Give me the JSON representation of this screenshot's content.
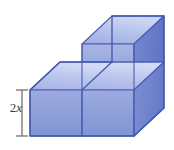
{
  "figure": {
    "background_color": "#ffffff",
    "credit": "Ilustrações: DAE",
    "dimension": {
      "label_prefix": "2",
      "label_variable": "x",
      "label_full": "2x",
      "measures": "height of lower cube layer",
      "bracket_color": "#7b7b7b"
    },
    "colors": {
      "face_top": "#aebae8",
      "face_top_light": "#c3cdee",
      "face_front": "#8f9fdb",
      "face_front_light": "#a3b1e2",
      "face_right": "#6f83cf",
      "face_right_dark": "#6276c6",
      "edge": "#4a5fb5",
      "outline": "#3f55ad"
    },
    "solid": {
      "type": "cube-stack",
      "description": "Three unit cubes: two side by side on the bottom row, one stacked on the right-hand bottom cube",
      "cube_count": 3,
      "bottom_row_cubes": 2,
      "top_row_cubes": 1,
      "projection": "oblique / cabinet"
    },
    "geometry": {
      "unit_width": 52,
      "depth_dx": 30,
      "depth_dy": -28,
      "unit_height": 46,
      "origin_x": 30,
      "origin_y": 136,
      "vertices": {
        "bottom_front_left_lower": [
          30,
          136
        ],
        "bottom_front_mid_lower": [
          82,
          136
        ],
        "bottom_front_right_lower": [
          134,
          136
        ],
        "bottom_front_left_upper": [
          30,
          90
        ],
        "bottom_front_mid_upper": [
          82,
          90
        ],
        "bottom_front_right_upper": [
          134,
          90
        ],
        "bottom_back_left_upper": [
          60,
          62
        ],
        "bottom_back_mid_upper": [
          112,
          62
        ],
        "bottom_back_right_upper": [
          164,
          62
        ],
        "bottom_back_right_lower": [
          164,
          108
        ],
        "top_front_mid_upper": [
          82,
          44
        ],
        "top_front_right_upper": [
          134,
          44
        ],
        "top_back_mid_upper": [
          112,
          16
        ],
        "top_back_right_upper": [
          164,
          16
        ],
        "top_back_right_lower": [
          164,
          62
        ]
      }
    }
  }
}
